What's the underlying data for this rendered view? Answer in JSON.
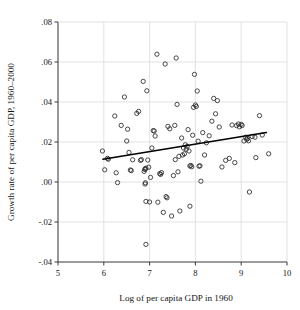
{
  "chart_data": {
    "type": "scatter",
    "title": "",
    "xlabel": "Log of per capita GDP in 1960",
    "ylabel": "Growth rate of per capita GDP, 1960–2000",
    "xlim": [
      5,
      10
    ],
    "ylim": [
      -0.04,
      0.08
    ],
    "xticks": [
      5,
      6,
      7,
      8,
      9,
      10
    ],
    "xtick_labels": [
      "5",
      "6",
      "7",
      "8",
      "9",
      "10"
    ],
    "yticks": [
      -0.04,
      -0.02,
      0.0,
      0.02,
      0.04,
      0.06,
      0.08
    ],
    "ytick_labels": [
      "-.04",
      "-.02",
      ".00",
      ".02",
      ".04",
      ".06",
      ".08"
    ],
    "grid": true,
    "grid_axes": "both",
    "legend": null,
    "marker": "open-circle",
    "marker_color": "#2b2b2b",
    "fit_line": {
      "label": "linear fit",
      "color": "#000000",
      "x_start": 5.98,
      "y_start": 0.0114,
      "x_end": 9.55,
      "y_end": 0.0247,
      "slope": 0.00372,
      "intercept": -0.0108
    },
    "points": [
      [
        5.97,
        0.0155
      ],
      [
        6.02,
        0.0061
      ],
      [
        6.08,
        0.0118
      ],
      [
        6.1,
        0.0114
      ],
      [
        6.24,
        0.033
      ],
      [
        6.27,
        0.0046
      ],
      [
        6.3,
        -0.0003
      ],
      [
        6.38,
        0.0283
      ],
      [
        6.45,
        0.0425
      ],
      [
        6.5,
        0.0205
      ],
      [
        6.52,
        0.0264
      ],
      [
        6.55,
        0.0148
      ],
      [
        6.58,
        0.006
      ],
      [
        6.6,
        0.0057
      ],
      [
        6.63,
        0.0111
      ],
      [
        6.72,
        0.0343
      ],
      [
        6.76,
        0.0353
      ],
      [
        6.8,
        0.0108
      ],
      [
        6.82,
        0.0112
      ],
      [
        6.86,
        0.0503
      ],
      [
        6.88,
        0.0053
      ],
      [
        6.9,
        0.0066
      ],
      [
        6.9,
        0.0062
      ],
      [
        6.9,
        -0.001
      ],
      [
        6.91,
        -0.0004
      ],
      [
        6.92,
        0.0069
      ],
      [
        6.92,
        -0.0097
      ],
      [
        6.92,
        -0.0312
      ],
      [
        6.94,
        0.0456
      ],
      [
        6.96,
        0.011
      ],
      [
        6.98,
        0.0074
      ],
      [
        7.0,
        -0.01
      ],
      [
        7.02,
        0.0023
      ],
      [
        7.05,
        0.017
      ],
      [
        7.08,
        0.0257
      ],
      [
        7.1,
        0.0255
      ],
      [
        7.12,
        0.023
      ],
      [
        7.16,
        0.0639
      ],
      [
        7.18,
        -0.0101
      ],
      [
        7.22,
        0.0042
      ],
      [
        7.24,
        0.0038
      ],
      [
        7.26,
        0.0047
      ],
      [
        7.3,
        -0.0152
      ],
      [
        7.34,
        0.059
      ],
      [
        7.36,
        -0.0073
      ],
      [
        7.38,
        -0.0079
      ],
      [
        7.4,
        0.0278
      ],
      [
        7.44,
        0.0266
      ],
      [
        7.48,
        -0.017
      ],
      [
        7.52,
        0.0032
      ],
      [
        7.55,
        0.0283
      ],
      [
        7.56,
        0.0112
      ],
      [
        7.58,
        0.062
      ],
      [
        7.6,
        0.0388
      ],
      [
        7.62,
        0.0051
      ],
      [
        7.64,
        0.0128
      ],
      [
        7.66,
        -0.0145
      ],
      [
        7.7,
        0.022
      ],
      [
        7.72,
        0.0135
      ],
      [
        7.74,
        0.017
      ],
      [
        7.76,
        0.0141
      ],
      [
        7.78,
        0.0186
      ],
      [
        7.8,
        0.0164
      ],
      [
        7.82,
        0.0178
      ],
      [
        7.84,
        0.0262
      ],
      [
        7.86,
        0.0155
      ],
      [
        7.88,
        0.008
      ],
      [
        7.88,
        -0.0121
      ],
      [
        7.9,
        0.0083
      ],
      [
        7.92,
        0.0076
      ],
      [
        7.94,
        0.0234
      ],
      [
        7.96,
        0.0373
      ],
      [
        7.98,
        0.0538
      ],
      [
        8.0,
        0.0385
      ],
      [
        8.02,
        0.0378
      ],
      [
        8.04,
        0.0455
      ],
      [
        8.06,
        0.0204
      ],
      [
        8.08,
        0.0079
      ],
      [
        8.1,
        0.0081
      ],
      [
        8.12,
        0.0004
      ],
      [
        8.16,
        0.0247
      ],
      [
        8.2,
        0.0135
      ],
      [
        8.24,
        0.0196
      ],
      [
        8.3,
        0.0231
      ],
      [
        8.36,
        0.0304
      ],
      [
        8.4,
        0.0418
      ],
      [
        8.44,
        0.0341
      ],
      [
        8.48,
        0.0407
      ],
      [
        8.52,
        0.0275
      ],
      [
        8.58,
        0.0075
      ],
      [
        8.66,
        0.0108
      ],
      [
        8.74,
        0.0118
      ],
      [
        8.8,
        0.0285
      ],
      [
        8.86,
        0.0097
      ],
      [
        8.9,
        0.0282
      ],
      [
        8.94,
        0.029
      ],
      [
        8.96,
        0.0276
      ],
      [
        9.0,
        0.0288
      ],
      [
        9.02,
        0.0282
      ],
      [
        9.06,
        0.0205
      ],
      [
        9.1,
        0.0224
      ],
      [
        9.12,
        0.0213
      ],
      [
        9.14,
        0.0218
      ],
      [
        9.16,
        0.0206
      ],
      [
        9.18,
        -0.005
      ],
      [
        9.24,
        0.0228
      ],
      [
        9.3,
        0.0224
      ],
      [
        9.32,
        0.0122
      ],
      [
        9.4,
        0.0332
      ],
      [
        9.46,
        0.0235
      ],
      [
        9.6,
        0.0141
      ]
    ]
  },
  "figure": {
    "background": "#ffffff",
    "axis_color": "#3a3a3a",
    "grid_color": "#d6d6d6"
  }
}
